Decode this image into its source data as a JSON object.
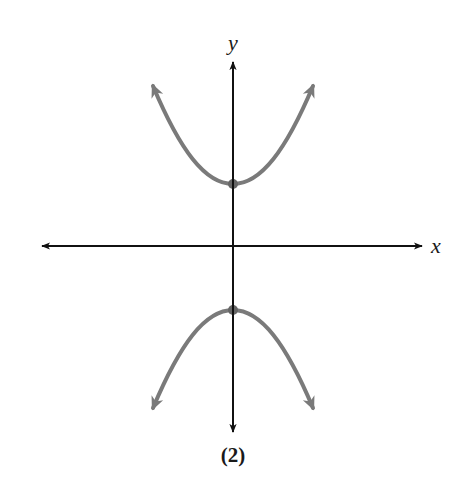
{
  "figure": {
    "caption": "(2)",
    "axes": {
      "x_label": "x",
      "y_label": "y",
      "origin_px": [
        233,
        246
      ],
      "axis_color": "#111111"
    },
    "curves": [
      {
        "name": "upper-branch",
        "shape": "upward-opening parabola",
        "vertex_px": [
          233,
          184
        ],
        "color": "#7a7a7a"
      },
      {
        "name": "lower-branch",
        "shape": "downward-opening parabola",
        "vertex_px": [
          233,
          310
        ],
        "color": "#7a7a7a"
      }
    ],
    "points": [
      {
        "name": "upper-vertex",
        "px": [
          233,
          184
        ]
      },
      {
        "name": "lower-vertex",
        "px": [
          233,
          310
        ]
      }
    ]
  }
}
